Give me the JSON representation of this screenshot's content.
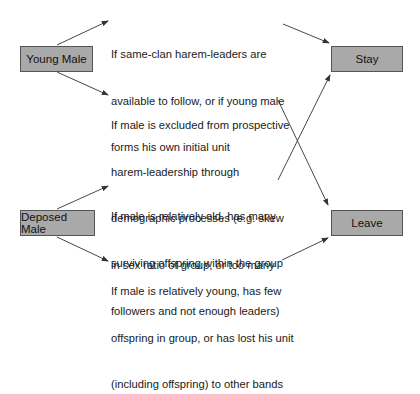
{
  "nodes": {
    "young_male": "Young Male",
    "deposed_male": "Deposed Male",
    "stay": "Stay",
    "leave": "Leave"
  },
  "conditions": {
    "young_stay": [
      "If same-clan harem-leaders are",
      "available to follow, or if young male",
      "forms his own initial unit"
    ],
    "young_leave": [
      "If male is excluded from prospective",
      "harem-leadership through",
      "demographic processes (e.g. skew",
      "in sex ratio of group, or too many",
      "followers and not enough leaders)"
    ],
    "deposed_stay": [
      "If male is relatively old, has many",
      "surviving offspring within the group"
    ],
    "deposed_leave": [
      "If male is relatively young, has few",
      "offspring in group, or has lost his unit",
      "(including offspring) to other bands"
    ]
  },
  "colors": {
    "box_fill": "#a9a9a9",
    "box_border": "#555555",
    "arrow": "#333333"
  }
}
